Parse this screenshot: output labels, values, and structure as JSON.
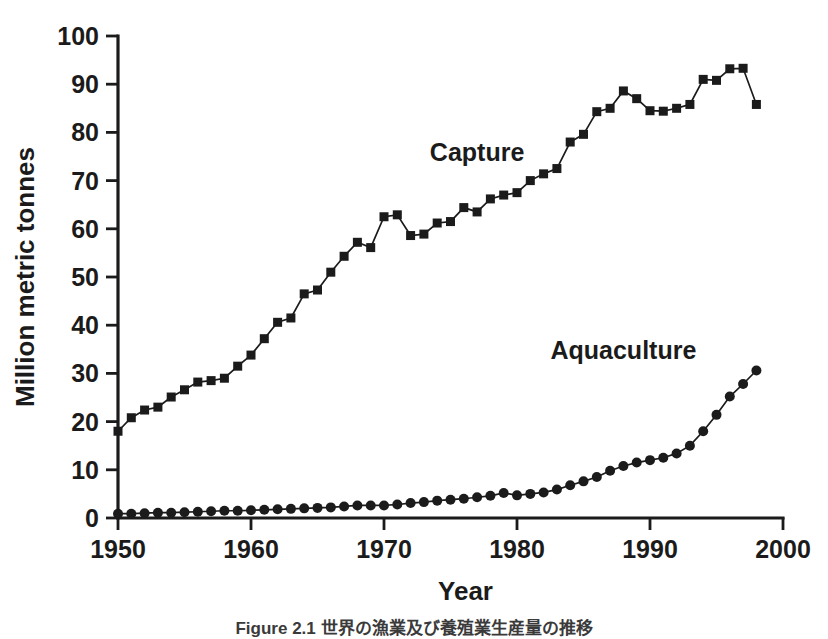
{
  "figure": {
    "background": "#ffffff",
    "ink_color": "#1b1b1b",
    "caption": "Figure 2.1  世界の漁業及び養殖業生産量の推移"
  },
  "chart_data": {
    "type": "line",
    "title": "",
    "subtitle": "",
    "xlabel": "Year",
    "ylabel": "Million metric tonnes",
    "xlim": [
      1950,
      2000
    ],
    "ylim": [
      0,
      100
    ],
    "grid": false,
    "legend_position": "inline-annotation",
    "x_ticks": [
      1950,
      1960,
      1970,
      1980,
      1990,
      2000
    ],
    "x_tick_labels": [
      "1950",
      "1960",
      "1970",
      "1980",
      "1990",
      "2000"
    ],
    "y_ticks": [
      0,
      10,
      20,
      30,
      40,
      50,
      60,
      70,
      80,
      90,
      100
    ],
    "y_tick_labels": [
      "0",
      "10",
      "20",
      "30",
      "40",
      "50",
      "60",
      "70",
      "80",
      "90",
      "100"
    ],
    "annotations": [
      {
        "text": "Capture",
        "x": 1977,
        "y": 74
      },
      {
        "text": "Aquaculture",
        "x": 1988,
        "y": 33
      }
    ],
    "series": [
      {
        "name": "Capture",
        "marker": "square",
        "x": [
          1950,
          1951,
          1952,
          1953,
          1954,
          1955,
          1956,
          1957,
          1958,
          1959,
          1960,
          1961,
          1962,
          1963,
          1964,
          1965,
          1966,
          1967,
          1968,
          1969,
          1970,
          1971,
          1972,
          1973,
          1974,
          1975,
          1976,
          1977,
          1978,
          1979,
          1980,
          1981,
          1982,
          1983,
          1984,
          1985,
          1986,
          1987,
          1988,
          1989,
          1990,
          1991,
          1992,
          1993,
          1994,
          1995,
          1996,
          1997,
          1998
        ],
        "values": [
          18.0,
          20.8,
          22.4,
          23.0,
          25.1,
          26.6,
          28.2,
          28.5,
          29.0,
          31.5,
          33.8,
          37.2,
          40.6,
          41.5,
          46.5,
          47.3,
          51.0,
          54.3,
          57.2,
          56.1,
          62.5,
          62.9,
          58.6,
          58.9,
          61.2,
          61.5,
          64.4,
          63.5,
          66.2,
          67.0,
          67.5,
          70.0,
          71.4,
          72.5,
          78.0,
          79.6,
          84.3,
          85.0,
          88.6,
          87.0,
          84.5,
          84.4,
          85.0,
          85.8,
          91.0,
          90.8,
          93.2,
          93.3,
          85.8
        ]
      },
      {
        "name": "Aquaculture",
        "marker": "circle",
        "x": [
          1950,
          1951,
          1952,
          1953,
          1954,
          1955,
          1956,
          1957,
          1958,
          1959,
          1960,
          1961,
          1962,
          1963,
          1964,
          1965,
          1966,
          1967,
          1968,
          1969,
          1970,
          1971,
          1972,
          1973,
          1974,
          1975,
          1976,
          1977,
          1978,
          1979,
          1980,
          1981,
          1982,
          1983,
          1984,
          1985,
          1986,
          1987,
          1988,
          1989,
          1990,
          1991,
          1992,
          1993,
          1994,
          1995,
          1996,
          1997,
          1998
        ],
        "values": [
          0.9,
          0.9,
          1.0,
          1.1,
          1.1,
          1.2,
          1.3,
          1.4,
          1.5,
          1.5,
          1.6,
          1.7,
          1.8,
          1.9,
          2.0,
          2.1,
          2.2,
          2.4,
          2.6,
          2.6,
          2.6,
          2.8,
          3.1,
          3.3,
          3.6,
          3.8,
          4.0,
          4.3,
          4.6,
          5.2,
          4.7,
          5.0,
          5.3,
          5.9,
          6.8,
          7.6,
          8.5,
          9.8,
          10.8,
          11.5,
          12.0,
          12.5,
          13.4,
          15.0,
          18.0,
          21.4,
          25.2,
          27.8,
          30.6
        ]
      }
    ]
  },
  "layout": {
    "plot_left_px": 118,
    "plot_right_px": 783,
    "plot_bottom_px": 518,
    "plot_top_px": 36,
    "tick_len_px": 12,
    "marker_square_size_px": 9,
    "marker_circle_radius_px": 5
  }
}
